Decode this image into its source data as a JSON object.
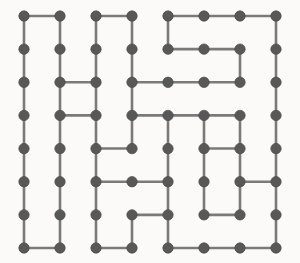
{
  "diagram": {
    "type": "node-link-grid",
    "canvas": {
      "width": 300,
      "height": 263,
      "background": "#fbfaf8"
    },
    "grid": {
      "columns": 8,
      "rows": 8,
      "origin_x": 24,
      "origin_y": 16,
      "spacing_x": 36,
      "spacing_y": 33.14
    },
    "style": {
      "node_color": "#585858",
      "node_edge_color": "#4a4a4a",
      "node_radius": 5.2,
      "edge_color": "#7a7a7a",
      "edge_width": 2.6
    },
    "nodes_label": "lattice-vertex",
    "horizontal_edges": [
      {
        "row": 0,
        "from_col": 0,
        "to_col": 1
      },
      {
        "row": 0,
        "from_col": 2,
        "to_col": 3
      },
      {
        "row": 0,
        "from_col": 4,
        "to_col": 5
      },
      {
        "row": 0,
        "from_col": 5,
        "to_col": 6
      },
      {
        "row": 0,
        "from_col": 6,
        "to_col": 7
      },
      {
        "row": 1,
        "from_col": 4,
        "to_col": 5
      },
      {
        "row": 1,
        "from_col": 5,
        "to_col": 6
      },
      {
        "row": 2,
        "from_col": 1,
        "to_col": 2
      },
      {
        "row": 2,
        "from_col": 3,
        "to_col": 4
      },
      {
        "row": 2,
        "from_col": 4,
        "to_col": 5
      },
      {
        "row": 2,
        "from_col": 5,
        "to_col": 6
      },
      {
        "row": 3,
        "from_col": 1,
        "to_col": 2
      },
      {
        "row": 3,
        "from_col": 3,
        "to_col": 4
      },
      {
        "row": 3,
        "from_col": 4,
        "to_col": 5
      },
      {
        "row": 3,
        "from_col": 5,
        "to_col": 6
      },
      {
        "row": 4,
        "from_col": 2,
        "to_col": 3
      },
      {
        "row": 4,
        "from_col": 5,
        "to_col": 6
      },
      {
        "row": 5,
        "from_col": 2,
        "to_col": 3
      },
      {
        "row": 5,
        "from_col": 3,
        "to_col": 4
      },
      {
        "row": 5,
        "from_col": 6,
        "to_col": 7
      },
      {
        "row": 6,
        "from_col": 3,
        "to_col": 4
      },
      {
        "row": 6,
        "from_col": 5,
        "to_col": 6
      },
      {
        "row": 7,
        "from_col": 0,
        "to_col": 1
      },
      {
        "row": 7,
        "from_col": 2,
        "to_col": 3
      },
      {
        "row": 7,
        "from_col": 4,
        "to_col": 5
      },
      {
        "row": 7,
        "from_col": 5,
        "to_col": 6
      },
      {
        "row": 7,
        "from_col": 6,
        "to_col": 7
      }
    ],
    "vertical_edges": [
      {
        "col": 0,
        "from_row": 0,
        "to_row": 1
      },
      {
        "col": 1,
        "from_row": 0,
        "to_row": 1
      },
      {
        "col": 2,
        "from_row": 0,
        "to_row": 1
      },
      {
        "col": 3,
        "from_row": 0,
        "to_row": 1
      },
      {
        "col": 4,
        "from_row": 0,
        "to_row": 1
      },
      {
        "col": 7,
        "from_row": 0,
        "to_row": 1
      },
      {
        "col": 0,
        "from_row": 1,
        "to_row": 2
      },
      {
        "col": 1,
        "from_row": 1,
        "to_row": 2
      },
      {
        "col": 2,
        "from_row": 1,
        "to_row": 2
      },
      {
        "col": 3,
        "from_row": 1,
        "to_row": 2
      },
      {
        "col": 6,
        "from_row": 1,
        "to_row": 2
      },
      {
        "col": 7,
        "from_row": 1,
        "to_row": 2
      },
      {
        "col": 0,
        "from_row": 2,
        "to_row": 3
      },
      {
        "col": 1,
        "from_row": 2,
        "to_row": 3
      },
      {
        "col": 2,
        "from_row": 2,
        "to_row": 3
      },
      {
        "col": 3,
        "from_row": 2,
        "to_row": 3
      },
      {
        "col": 7,
        "from_row": 2,
        "to_row": 3
      },
      {
        "col": 0,
        "from_row": 3,
        "to_row": 4
      },
      {
        "col": 1,
        "from_row": 3,
        "to_row": 4
      },
      {
        "col": 2,
        "from_row": 3,
        "to_row": 4
      },
      {
        "col": 3,
        "from_row": 3,
        "to_row": 4
      },
      {
        "col": 4,
        "from_row": 3,
        "to_row": 4
      },
      {
        "col": 5,
        "from_row": 3,
        "to_row": 4
      },
      {
        "col": 6,
        "from_row": 3,
        "to_row": 4
      },
      {
        "col": 7,
        "from_row": 3,
        "to_row": 4
      },
      {
        "col": 0,
        "from_row": 4,
        "to_row": 5
      },
      {
        "col": 1,
        "from_row": 4,
        "to_row": 5
      },
      {
        "col": 2,
        "from_row": 4,
        "to_row": 5
      },
      {
        "col": 4,
        "from_row": 4,
        "to_row": 5
      },
      {
        "col": 5,
        "from_row": 4,
        "to_row": 5
      },
      {
        "col": 6,
        "from_row": 4,
        "to_row": 5
      },
      {
        "col": 7,
        "from_row": 4,
        "to_row": 5
      },
      {
        "col": 0,
        "from_row": 5,
        "to_row": 6
      },
      {
        "col": 1,
        "from_row": 5,
        "to_row": 6
      },
      {
        "col": 2,
        "from_row": 5,
        "to_row": 6
      },
      {
        "col": 4,
        "from_row": 5,
        "to_row": 6
      },
      {
        "col": 5,
        "from_row": 5,
        "to_row": 6
      },
      {
        "col": 6,
        "from_row": 5,
        "to_row": 6
      },
      {
        "col": 7,
        "from_row": 5,
        "to_row": 6
      },
      {
        "col": 0,
        "from_row": 6,
        "to_row": 7
      },
      {
        "col": 1,
        "from_row": 6,
        "to_row": 7
      },
      {
        "col": 2,
        "from_row": 6,
        "to_row": 7
      },
      {
        "col": 3,
        "from_row": 6,
        "to_row": 7
      },
      {
        "col": 4,
        "from_row": 6,
        "to_row": 7
      },
      {
        "col": 7,
        "from_row": 6,
        "to_row": 7
      }
    ]
  }
}
